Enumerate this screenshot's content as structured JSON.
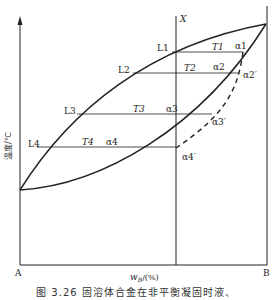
{
  "figure": {
    "caption": "图 3.26   固溶体合金在非平衡凝固时液、",
    "y_axis_label": "温度/℃",
    "x_axis_label": "w",
    "x_axis_subscript": "B",
    "x_axis_unit": "/(%)",
    "left_end_label": "A",
    "right_end_label": "B",
    "composition_line_label": "X"
  },
  "labels": {
    "liquid": [
      "L1",
      "L2",
      "L3",
      "L4"
    ],
    "temperatures": [
      "T1",
      "T2",
      "T3",
      "T4"
    ],
    "solid_equilibrium": [
      "α1",
      "α2",
      "α3",
      "α4"
    ],
    "solid_nonequilibrium": [
      "α2′",
      "α3′",
      "α4′"
    ]
  },
  "colors": {
    "line": "#222222",
    "background": "#ffffff"
  }
}
